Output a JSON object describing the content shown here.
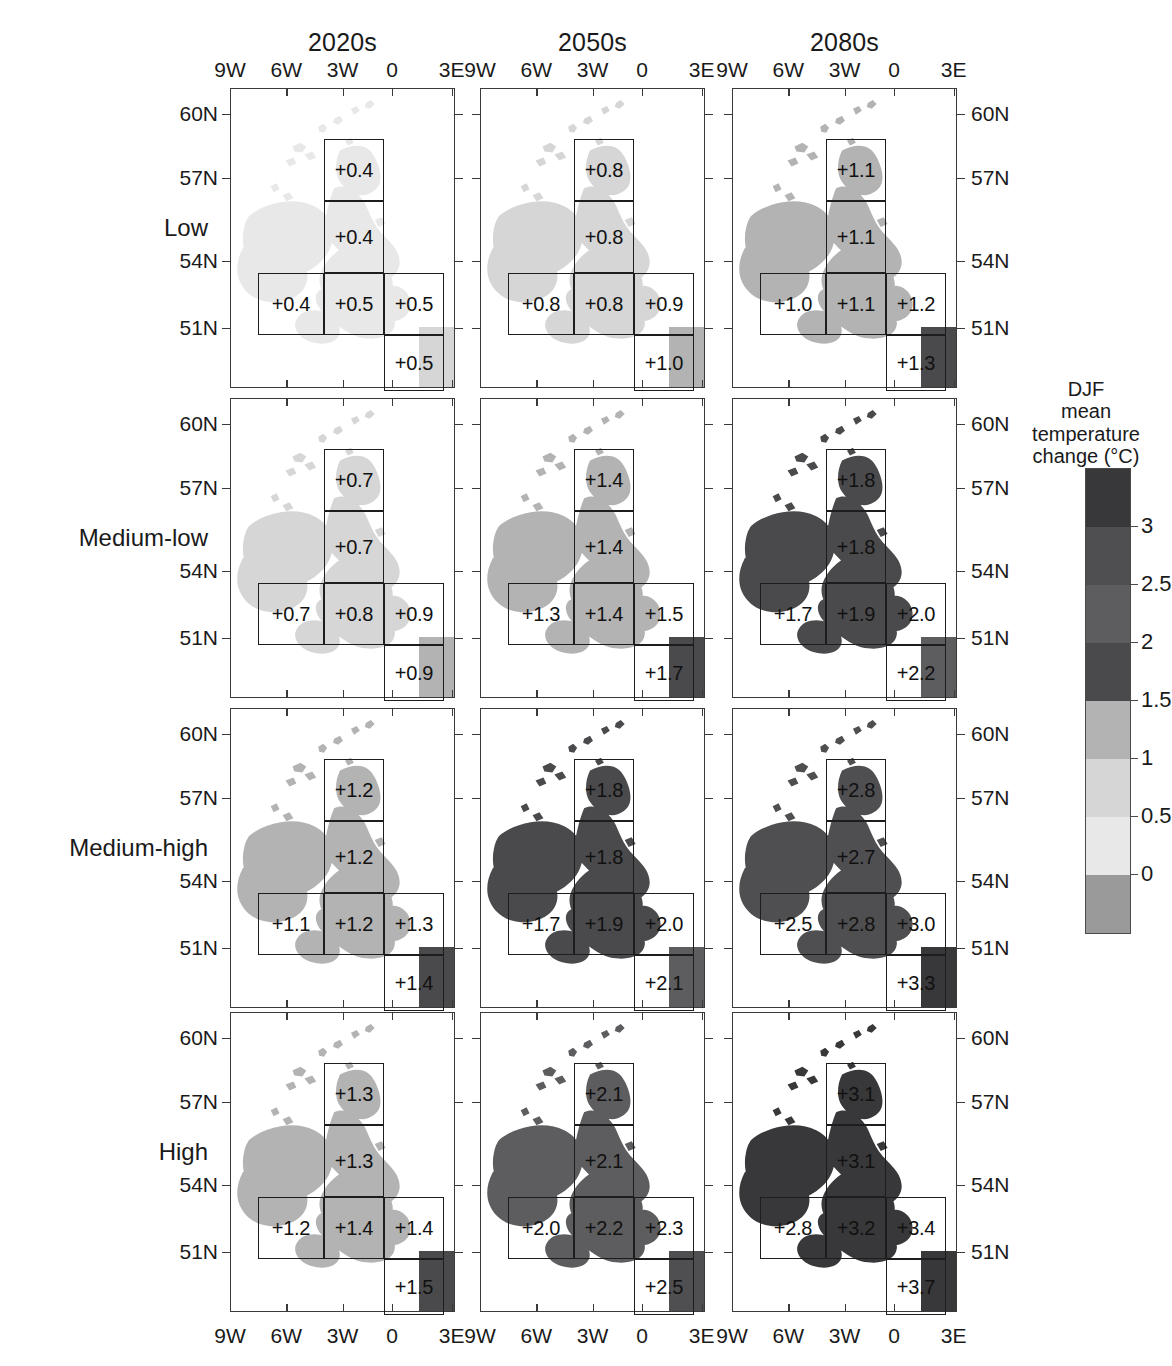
{
  "figure": {
    "column_titles": [
      "2020s",
      "2050s",
      "2080s"
    ],
    "row_labels": [
      "Low",
      "Medium-low",
      "Medium-high",
      "High"
    ],
    "x_tick_labels": [
      "9W",
      "6W",
      "3W",
      "0",
      "3E"
    ],
    "y_tick_labels": [
      "60N",
      "57N",
      "54N",
      "51N"
    ]
  },
  "colorbar": {
    "title_lines": [
      "DJF",
      "mean",
      "temperature",
      "change (°C)"
    ],
    "title_full": "DJF mean temperature change (°C)",
    "tick_labels": [
      "3",
      "2.5",
      "2",
      "1.5",
      "1",
      "0.5",
      "0"
    ],
    "segment_colors": [
      "#38383a",
      "#4f4f51",
      "#5d5d5f",
      "#4a4a4c",
      "#b3b3b3",
      "#d6d6d6",
      "#e8e8e8",
      "#9a9a9a"
    ],
    "tick_values": [
      3,
      2.5,
      2,
      1.5,
      1,
      0.5,
      0
    ]
  },
  "chart_data": {
    "type": "heatmap",
    "xlabel": "Longitude",
    "ylabel": "Latitude",
    "x": [
      "9W",
      "6W",
      "3W",
      "0",
      "3E"
    ],
    "y": [
      "60N",
      "57N",
      "54N",
      "51N"
    ],
    "columns": [
      "2020s",
      "2050s",
      "2080s"
    ],
    "rows": [
      "Low",
      "Medium-low",
      "Medium-high",
      "High"
    ],
    "regions": [
      "N Scotland",
      "S Scotland / N England",
      "Ireland",
      "Wales / W England",
      "SE England",
      "Channel / S coast"
    ],
    "panels": [
      {
        "row": "Low",
        "column": "2020s",
        "values": {
          "north_scotland": "+0.4",
          "central": "+0.4",
          "west": "+0.4",
          "mid": "+0.5",
          "east": "+0.5",
          "south": "+0.5"
        }
      },
      {
        "row": "Low",
        "column": "2050s",
        "values": {
          "north_scotland": "+0.8",
          "central": "+0.8",
          "west": "+0.8",
          "mid": "+0.8",
          "east": "+0.9",
          "south": "+1.0"
        }
      },
      {
        "row": "Low",
        "column": "2080s",
        "values": {
          "north_scotland": "+1.1",
          "central": "+1.1",
          "west": "+1.0",
          "mid": "+1.1",
          "east": "+1.2",
          "south": "+1.3"
        }
      },
      {
        "row": "Medium-low",
        "column": "2020s",
        "values": {
          "north_scotland": "+0.7",
          "central": "+0.7",
          "west": "+0.7",
          "mid": "+0.8",
          "east": "+0.9",
          "south": "+0.9"
        }
      },
      {
        "row": "Medium-low",
        "column": "2050s",
        "values": {
          "north_scotland": "+1.4",
          "central": "+1.4",
          "west": "+1.3",
          "mid": "+1.4",
          "east": "+1.5",
          "south": "+1.7"
        }
      },
      {
        "row": "Medium-low",
        "column": "2080s",
        "values": {
          "north_scotland": "+1.8",
          "central": "+1.8",
          "west": "+1.7",
          "mid": "+1.9",
          "east": "+2.0",
          "south": "+2.2"
        }
      },
      {
        "row": "Medium-high",
        "column": "2020s",
        "values": {
          "north_scotland": "+1.2",
          "central": "+1.2",
          "west": "+1.1",
          "mid": "+1.2",
          "east": "+1.3",
          "south": "+1.4"
        }
      },
      {
        "row": "Medium-high",
        "column": "2050s",
        "values": {
          "north_scotland": "+1.8",
          "central": "+1.8",
          "west": "+1.7",
          "mid": "+1.9",
          "east": "+2.0",
          "south": "+2.1"
        }
      },
      {
        "row": "Medium-high",
        "column": "2080s",
        "values": {
          "north_scotland": "+2.8",
          "central": "+2.7",
          "west": "+2.5",
          "mid": "+2.8",
          "east": "+3.0",
          "south": "+3.3"
        }
      },
      {
        "row": "High",
        "column": "2020s",
        "values": {
          "north_scotland": "+1.3",
          "central": "+1.3",
          "west": "+1.2",
          "mid": "+1.4",
          "east": "+1.4",
          "south": "+1.5"
        }
      },
      {
        "row": "High",
        "column": "2050s",
        "values": {
          "north_scotland": "+2.1",
          "central": "+2.1",
          "west": "+2.0",
          "mid": "+2.2",
          "east": "+2.3",
          "south": "+2.5"
        }
      },
      {
        "row": "High",
        "column": "2080s",
        "values": {
          "north_scotland": "+3.1",
          "central": "+3.1",
          "west": "+2.8",
          "mid": "+3.2",
          "east": "+3.4",
          "south": "+3.7"
        }
      }
    ]
  }
}
